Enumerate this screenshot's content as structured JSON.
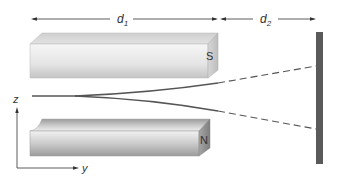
{
  "diagram": {
    "dimensions": [
      {
        "label": "d",
        "subscript": "1"
      },
      {
        "label": "d",
        "subscript": "2"
      }
    ],
    "magnets": {
      "top": {
        "pole": "S"
      },
      "bottom": {
        "pole": "N"
      }
    },
    "axes": {
      "vertical": "z",
      "horizontal": "y"
    },
    "colors": {
      "screen": "#5a5a5a",
      "beam": "#555555",
      "magnet_light": "#f2f2f2",
      "magnet_dark": "#a8a8a8"
    }
  }
}
